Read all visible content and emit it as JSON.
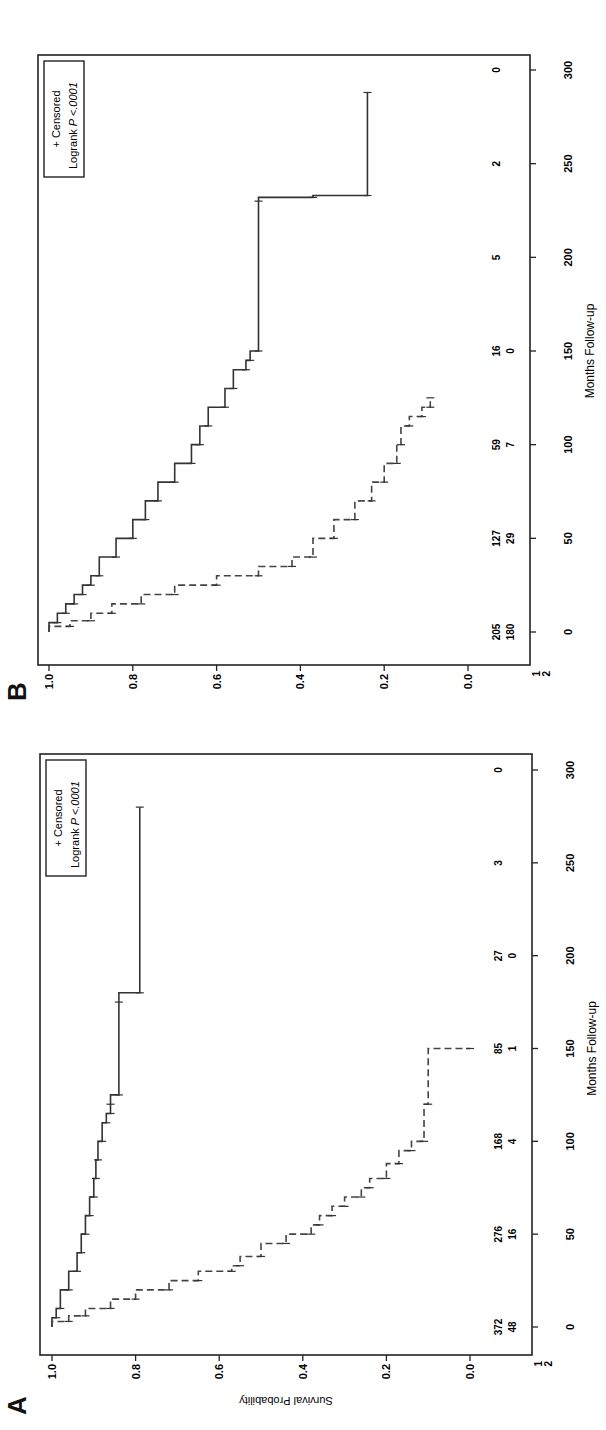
{
  "chart_data": [
    {
      "panel": "A",
      "type": "line",
      "subtype": "kaplan-meier",
      "title": "",
      "xlabel": "Months Follow-up",
      "ylabel": "Survival Probability",
      "xlim": [
        0,
        300
      ],
      "ylim": [
        0.0,
        1.0
      ],
      "xticks": [
        0,
        50,
        100,
        150,
        200,
        250,
        300
      ],
      "yticks": [
        "0.0",
        "0.2",
        "0.4",
        "0.6",
        "0.8",
        "1.0"
      ],
      "grid": false,
      "legend": {
        "position": "top-right",
        "entries": [
          "+ Censored",
          "Logrank P <.0001"
        ]
      },
      "risk_table": {
        "groups": [
          "1",
          "2"
        ],
        "times": [
          0,
          50,
          100,
          150,
          200,
          250,
          300
        ],
        "group1": [
          372,
          276,
          168,
          85,
          27,
          3,
          0
        ],
        "group2": [
          48,
          16,
          4,
          1,
          0,
          null,
          null
        ]
      },
      "series": [
        {
          "name": "1",
          "style": "solid",
          "x": [
            0,
            5,
            10,
            20,
            30,
            40,
            50,
            60,
            70,
            80,
            90,
            100,
            110,
            115,
            120,
            125,
            175,
            180,
            280
          ],
          "y": [
            1.0,
            0.99,
            0.98,
            0.96,
            0.94,
            0.93,
            0.92,
            0.91,
            0.9,
            0.895,
            0.89,
            0.88,
            0.87,
            0.86,
            0.86,
            0.84,
            0.84,
            0.79,
            0.79
          ]
        },
        {
          "name": "2",
          "style": "dashed",
          "x": [
            0,
            3,
            6,
            10,
            15,
            20,
            25,
            30,
            33,
            38,
            45,
            50,
            55,
            60,
            65,
            70,
            75,
            80,
            88,
            95,
            100,
            120,
            150
          ],
          "y": [
            1.0,
            0.96,
            0.92,
            0.86,
            0.8,
            0.72,
            0.65,
            0.57,
            0.55,
            0.5,
            0.44,
            0.38,
            0.36,
            0.33,
            0.3,
            0.26,
            0.24,
            0.2,
            0.17,
            0.14,
            0.11,
            0.1,
            0.0
          ]
        }
      ]
    },
    {
      "panel": "B",
      "type": "line",
      "subtype": "kaplan-meier",
      "title": "",
      "xlabel": "Months Follow-up",
      "ylabel": "Survival Probability",
      "xlim": [
        0,
        300
      ],
      "ylim": [
        0.0,
        1.0
      ],
      "xticks": [
        0,
        50,
        100,
        150,
        200,
        250,
        300
      ],
      "yticks": [
        "0.0",
        "0.2",
        "0.4",
        "0.6",
        "0.8",
        "1.0"
      ],
      "grid": false,
      "legend": {
        "position": "top-right",
        "entries": [
          "+ Censored",
          "Logrank P <.0001"
        ]
      },
      "risk_table": {
        "groups": [
          "1",
          "2"
        ],
        "times": [
          0,
          50,
          100,
          150,
          200,
          250,
          300
        ],
        "group1": [
          205,
          127,
          59,
          16,
          5,
          2,
          0
        ],
        "group2": [
          180,
          29,
          7,
          0,
          null,
          null,
          null
        ]
      },
      "series": [
        {
          "name": "1",
          "style": "solid",
          "x": [
            0,
            5,
            10,
            15,
            20,
            25,
            30,
            40,
            50,
            60,
            70,
            80,
            90,
            100,
            110,
            120,
            130,
            140,
            145,
            150,
            230,
            232,
            233,
            288
          ],
          "y": [
            1.0,
            0.98,
            0.96,
            0.94,
            0.92,
            0.9,
            0.88,
            0.84,
            0.8,
            0.77,
            0.74,
            0.7,
            0.66,
            0.64,
            0.62,
            0.58,
            0.56,
            0.53,
            0.52,
            0.5,
            0.5,
            0.37,
            0.24,
            0.24
          ]
        },
        {
          "name": "2",
          "style": "dashed",
          "x": [
            0,
            3,
            6,
            10,
            15,
            20,
            25,
            30,
            35,
            40,
            50,
            60,
            70,
            80,
            90,
            100,
            110,
            115,
            120,
            125
          ],
          "y": [
            1.0,
            0.95,
            0.9,
            0.85,
            0.78,
            0.7,
            0.6,
            0.5,
            0.42,
            0.37,
            0.32,
            0.27,
            0.23,
            0.2,
            0.17,
            0.16,
            0.14,
            0.11,
            0.09,
            0.09
          ]
        }
      ]
    }
  ],
  "panels": {
    "A": {
      "letter": "A",
      "xlabel": "Months Follow-up",
      "ylabel": "Survival Probability",
      "legend_censored": "+ Censored",
      "legend_logrank": "Logrank",
      "legend_p": "P <.0001",
      "group_labels": [
        "1",
        "2"
      ]
    },
    "B": {
      "letter": "B",
      "xlabel": "Months Follow-up",
      "ylabel": "Survival Probability",
      "legend_censored": "+ Censored",
      "legend_logrank": "Logrank",
      "legend_p": "P <.0001",
      "group_labels": [
        "1",
        "2"
      ]
    }
  }
}
